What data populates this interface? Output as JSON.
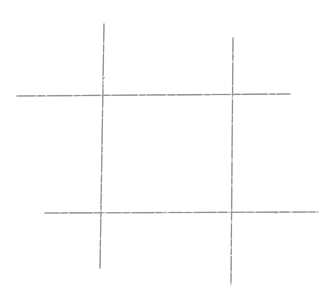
{
  "drawing": {
    "subject": "tic-tac-toe grid sketch",
    "medium": "pencil",
    "background": "#ffffff",
    "stroke_color": "#8f8f8f",
    "stroke_color_light": "#b8b8b8",
    "lines": [
      {
        "name": "left-vertical-line",
        "x1": 104,
        "y1": 24,
        "x2": 100,
        "y2": 268
      },
      {
        "name": "right-vertical-line",
        "x1": 233,
        "y1": 38,
        "x2": 231,
        "y2": 285
      },
      {
        "name": "top-horizontal-line",
        "x1": 17,
        "y1": 96,
        "x2": 290,
        "y2": 94
      },
      {
        "name": "bottom-horizontal-line",
        "x1": 45,
        "y1": 213,
        "x2": 318,
        "y2": 212
      }
    ]
  }
}
